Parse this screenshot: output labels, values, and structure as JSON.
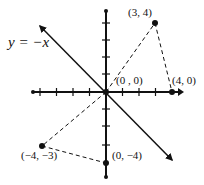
{
  "diagram": {
    "type": "coordinate-plane",
    "line_label": "y = −x",
    "origin_px": [
      106,
      92
    ],
    "unit_px": 16.5,
    "points": [
      {
        "id": "p34",
        "label": "(3, 4)",
        "x": 3,
        "y": 4
      },
      {
        "id": "p00",
        "label": "(0 , 0)",
        "x": 0,
        "y": 0
      },
      {
        "id": "p40",
        "label": "(4, 0)",
        "x": 4,
        "y": 0
      },
      {
        "id": "pm4m3",
        "label": "(−4, −3)",
        "x": -4,
        "y": -3
      },
      {
        "id": "p0m4",
        "label": "(0, −4)",
        "x": 0,
        "y": -4
      }
    ],
    "dashed_segments": [
      [
        "p00",
        "p34"
      ],
      [
        "p34",
        "p40"
      ],
      [
        "p00",
        "pm4m3"
      ],
      [
        "pm4m3",
        "p0m4"
      ]
    ],
    "colors": {
      "ink": "#111111",
      "background": "#ffffff"
    }
  }
}
